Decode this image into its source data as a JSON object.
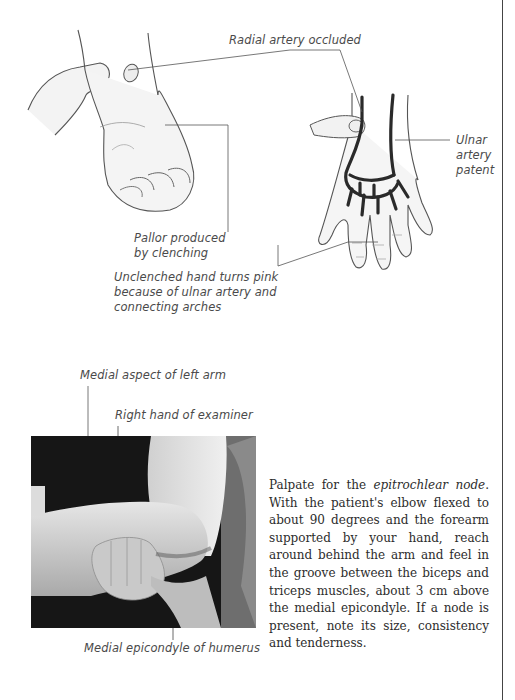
{
  "figure_top": {
    "labels": {
      "radial_artery": "Radial artery occluded",
      "ulnar_artery_line1": "Ulnar",
      "ulnar_artery_line2": "artery",
      "ulnar_artery_line3": "patent",
      "pallor_line1": "Pallor produced",
      "pallor_line2": "by clenching",
      "unclenched_line1": "Unclenched hand turns pink",
      "unclenched_line2": "because of ulnar artery and",
      "unclenched_line3": "connecting arches"
    },
    "illustrations": [
      "clenched-fist-hand",
      "open-palm-hand-with-arteries"
    ]
  },
  "figure_bottom": {
    "labels": {
      "medial_aspect": "Medial aspect of left arm",
      "right_hand": "Right hand of examiner",
      "medial_epicondyle": "Medial epicondyle of humerus"
    },
    "photo": "examiner-palpating-elbow-photo"
  },
  "body_text": {
    "intro": "Palpate for the ",
    "term": "epitrochlear node",
    "rest": ". With the patient's elbow flexed to about 90 degrees and the forearm supported by your hand, reach around behind the arm and feel in the groove between the biceps and triceps muscles, about 3 cm above the medial epicondyle. If a node is present, note its size, consistency and tenderness."
  },
  "colors": {
    "artery": "#2a2a2a",
    "label_text": "#4a4a4a",
    "leader_line": "#555555",
    "rule": "#444444"
  }
}
